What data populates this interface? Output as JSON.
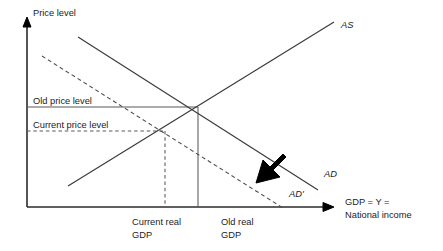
{
  "figure": {
    "type": "economics-ad-as-diagram",
    "background_color": "#ffffff",
    "line_color": "#3a3a3a",
    "arrow_color": "#000000"
  },
  "axes": {
    "y_axis_label": "Price level",
    "x_axis_label_line1": "GDP = Y =",
    "x_axis_label_line2": "National income",
    "origin": {
      "x": 27,
      "y": 207
    },
    "y_axis_top": 22,
    "x_axis_right": 330
  },
  "curves": [
    {
      "id": "as",
      "label": "AS",
      "style": "solid",
      "description": "aggregate supply, upward sloping",
      "label_x": 341,
      "label_y": 28
    },
    {
      "id": "ad",
      "label": "AD",
      "style": "solid",
      "description": "original aggregate demand, downward sloping",
      "label_x": 324,
      "label_y": 177
    },
    {
      "id": "ad-prime",
      "label": "AD'",
      "style": "dashed",
      "description": "new aggregate demand after leftward shift",
      "label_x": 289,
      "label_y": 197
    }
  ],
  "price_levels": [
    {
      "id": "old-price-level",
      "label": "Old price level",
      "line_style": "solid",
      "y": 107
    },
    {
      "id": "current-price-level",
      "label": "Current price level",
      "line_style": "dashed",
      "y": 131
    }
  ],
  "output_levels": [
    {
      "id": "current-real-gdp",
      "label_line1": "Current real",
      "label_line2": "GDP",
      "line_style": "dashed",
      "x": 165
    },
    {
      "id": "old-real-gdp",
      "label_line1": "Old real",
      "label_line2": "GDP",
      "line_style": "solid",
      "x": 198
    }
  ],
  "equilibria": [
    {
      "id": "old-equilibrium",
      "x": 198,
      "y": 107
    },
    {
      "id": "new-equilibrium",
      "x": 165,
      "y": 131
    }
  ],
  "shift_arrow": {
    "id": "ad-shift-arrow",
    "direction": "down-left",
    "meaning": "leftward shift of aggregate demand"
  }
}
